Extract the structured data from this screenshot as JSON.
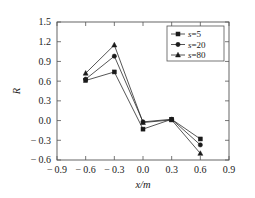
{
  "chart_data": {
    "type": "line",
    "title": "",
    "xlabel": "x/m",
    "ylabel": "R",
    "xlim": [
      -0.9,
      0.9
    ],
    "ylim": [
      -0.6,
      1.5
    ],
    "x": [
      -0.6,
      -0.3,
      0.0,
      0.3,
      0.6
    ],
    "xticks": [
      "-0.9",
      "-0.6",
      "-0.3",
      "0.0",
      "0.3",
      "0.6",
      "0.9"
    ],
    "xtick_values": [
      -0.9,
      -0.6,
      -0.3,
      0.0,
      0.3,
      0.6,
      0.9
    ],
    "yticks": [
      "1.5",
      "1.2",
      "0.9",
      "0.6",
      "0.3",
      "0.0",
      "-0.3",
      "-0.6"
    ],
    "ytick_values": [
      1.5,
      1.2,
      0.9,
      0.6,
      0.3,
      0.0,
      -0.3,
      -0.6
    ],
    "grid": false,
    "legend_position": "top-right",
    "series": [
      {
        "name": "s=5",
        "var": "s",
        "value": "=5",
        "marker": "square",
        "values": [
          0.61,
          0.74,
          -0.13,
          0.02,
          -0.28
        ]
      },
      {
        "name": "s=20",
        "var": "s",
        "value": "=20",
        "marker": "circle",
        "values": [
          0.63,
          0.98,
          -0.02,
          0.02,
          -0.37
        ]
      },
      {
        "name": "s=80",
        "var": "s",
        "value": "=80",
        "marker": "triangle",
        "values": [
          0.72,
          1.15,
          -0.03,
          0.01,
          -0.5
        ]
      }
    ],
    "colors": {
      "line": "#2b2b2b",
      "marker": "#1a1a1a",
      "frame": "#555555",
      "background": "#ffffff"
    }
  }
}
